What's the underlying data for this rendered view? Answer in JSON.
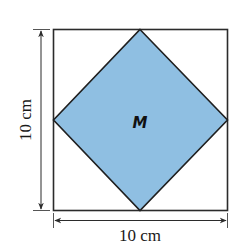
{
  "diagram": {
    "outer_square": {
      "side_length_label_vertical": "10 cm",
      "side_length_label_horizontal": "10 cm",
      "stroke_color": "#2b2b2b",
      "fill_color": "#ffffff"
    },
    "inner_square": {
      "label": "M",
      "fill_color": "#8fbfe2",
      "stroke_color": "#1f1f1f"
    },
    "dimensions": {
      "width": "10 cm",
      "height": "10 cm"
    }
  }
}
